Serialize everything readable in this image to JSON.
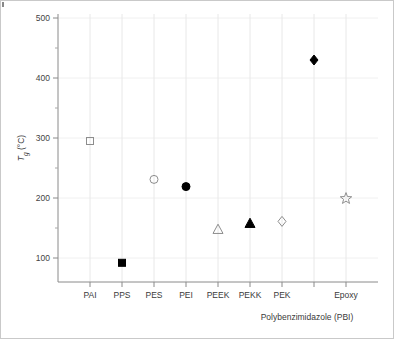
{
  "chart_data": {
    "type": "scatter",
    "title": "",
    "xlabel": "",
    "ylabel": "Tg (°C)",
    "ylabel_parts": {
      "main": "T",
      "sub": "g",
      "unit": " (°C)"
    },
    "ylim": [
      50,
      500
    ],
    "ytick_labels": [
      "100",
      "200",
      "300",
      "400",
      "500"
    ],
    "ytick_values": [
      100,
      200,
      300,
      400,
      500
    ],
    "yminor_values": [
      150,
      250,
      350,
      450
    ],
    "grid": "both",
    "legend": "none",
    "categories": [
      "PAI",
      "PPS",
      "PES",
      "PEI",
      "PEEK",
      "PEKK",
      "PEK",
      "",
      "Epoxy"
    ],
    "annotation": "Polybenzimidazole (PBI)",
    "points": [
      {
        "category": "PAI",
        "label": "PAI",
        "value": 295,
        "marker": "square",
        "fill": "open"
      },
      {
        "category": "PPS",
        "label": "PPS",
        "value": 92,
        "marker": "square",
        "fill": "filled"
      },
      {
        "category": "PES",
        "label": "PES",
        "value": 231,
        "marker": "circle",
        "fill": "open"
      },
      {
        "category": "PEI",
        "label": "PEI",
        "value": 219,
        "marker": "circle",
        "fill": "filled"
      },
      {
        "category": "PEEK",
        "label": "PEEK",
        "value": 148,
        "marker": "triangle",
        "fill": "open"
      },
      {
        "category": "PEKK",
        "label": "PEKK",
        "value": 158,
        "marker": "triangle",
        "fill": "filled"
      },
      {
        "category": "PEK",
        "label": "PEK",
        "value": 161,
        "marker": "diamond",
        "fill": "open"
      },
      {
        "category": "PBI",
        "label": "",
        "value": 430,
        "marker": "diamond",
        "fill": "filled"
      },
      {
        "category": "Epoxy",
        "label": "Epoxy",
        "value": 199,
        "marker": "star",
        "fill": "open"
      }
    ]
  },
  "colors": {
    "marker_filled": "#000000",
    "marker_open_stroke": "#8d8d8d",
    "axis": "#8a8a8a",
    "grid_vertical": "#e8e8e8",
    "grid_horizontal": "#f0f0f0",
    "text": "#3a3a3a",
    "frame": "#c9c9c9",
    "background": "#ffffff"
  }
}
